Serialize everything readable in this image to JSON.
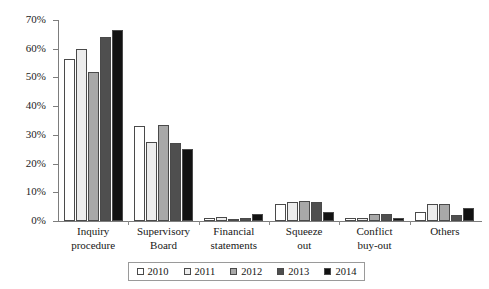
{
  "chart_data": {
    "type": "bar",
    "title": "",
    "subtitle": "",
    "xlabel": "",
    "ylabel": "",
    "ylim": [
      0,
      70
    ],
    "ytick_step": 10,
    "ytick_labels": [
      "70%",
      "60%",
      "50%",
      "40%",
      "30%",
      "20%",
      "10%",
      "0%"
    ],
    "ytick_values": [
      70,
      60,
      50,
      40,
      30,
      20,
      10,
      0
    ],
    "grid": false,
    "legend_position": "bottom",
    "categories": [
      "Inquiry procedure",
      "Supervisory Board",
      "Financial statements",
      "Squeeze out",
      "Conflict buy-out",
      "Others"
    ],
    "category_lines": [
      [
        "Inquiry",
        "procedure"
      ],
      [
        "Supervisory",
        "Board"
      ],
      [
        "Financial",
        "statements"
      ],
      [
        "Squeeze",
        "out"
      ],
      [
        "Conflict",
        "buy-out"
      ],
      [
        "Others",
        ""
      ]
    ],
    "series": [
      {
        "name": "2010",
        "color": "#ffffff",
        "values": [
          56.5,
          33.0,
          1.0,
          6.0,
          1.0,
          3.0
        ]
      },
      {
        "name": "2011",
        "color": "#ededed",
        "values": [
          60.0,
          27.5,
          1.5,
          6.5,
          1.0,
          6.0
        ]
      },
      {
        "name": "2012",
        "color": "#a8a8a8",
        "values": [
          52.0,
          33.5,
          0.5,
          7.0,
          2.5,
          6.0
        ]
      },
      {
        "name": "2013",
        "color": "#4f4f4f",
        "values": [
          64.0,
          27.0,
          1.0,
          6.5,
          2.5,
          2.0
        ]
      },
      {
        "name": "2014",
        "color": "#121212",
        "values": [
          66.5,
          25.0,
          2.5,
          3.0,
          1.0,
          4.5
        ]
      }
    ]
  },
  "legend": {
    "items": [
      {
        "label": "2010"
      },
      {
        "label": "2011"
      },
      {
        "label": "2012"
      },
      {
        "label": "2013"
      },
      {
        "label": "2014"
      }
    ]
  }
}
